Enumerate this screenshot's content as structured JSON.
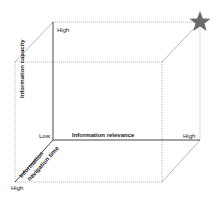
{
  "diagram": {
    "type": "3d-cube",
    "axes": {
      "y": {
        "label": "Information capacity",
        "low": "Low",
        "high": "High"
      },
      "x": {
        "label": "Information relevance",
        "high": "High"
      },
      "z": {
        "label_line1": "Information",
        "label_line2": "navigation time",
        "high": "High"
      }
    },
    "marker": {
      "icon": "star-icon",
      "color": "#6b6b6b",
      "position": "top-back-right corner"
    },
    "colors": {
      "edges": "#7a7a7a",
      "axes": "#1a1a1a",
      "star": "#6b6b6b"
    }
  }
}
